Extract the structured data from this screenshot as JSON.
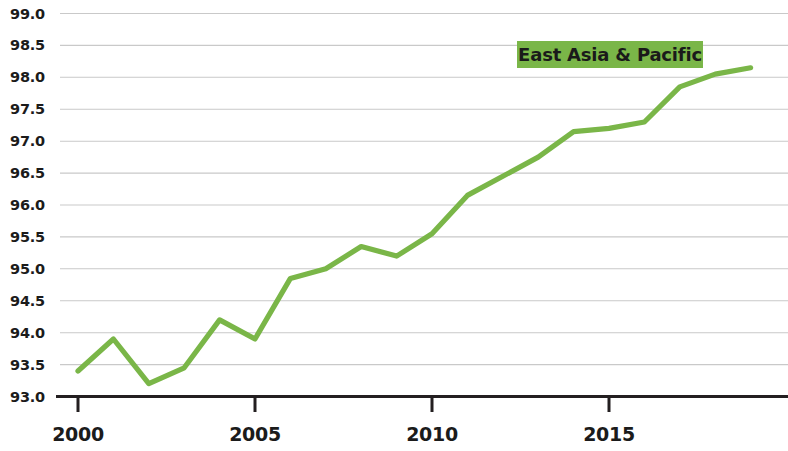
{
  "chart_data": {
    "type": "line",
    "title": "",
    "subtitle": "",
    "xlabel": "",
    "ylabel": "",
    "xlim": [
      2000,
      2019
    ],
    "ylim": [
      93.0,
      99.0
    ],
    "grid": true,
    "legend_position": "top-right",
    "x": [
      2000,
      2001,
      2002,
      2003,
      2004,
      2005,
      2006,
      2007,
      2008,
      2009,
      2010,
      2011,
      2012,
      2013,
      2014,
      2015,
      2016,
      2017,
      2018,
      2019
    ],
    "series": [
      {
        "name": "East Asia & Pacific",
        "color": "#7ab648",
        "values": [
          93.4,
          93.9,
          93.2,
          93.45,
          94.2,
          93.9,
          94.85,
          95.0,
          95.35,
          95.2,
          95.55,
          96.15,
          96.45,
          96.75,
          97.15,
          97.2,
          97.3,
          97.85,
          98.05,
          98.15
        ]
      }
    ],
    "y_ticks": [
      99.0,
      98.5,
      98.0,
      97.5,
      97.0,
      96.5,
      96.0,
      95.5,
      95.0,
      94.5,
      94.0,
      93.5,
      93.0
    ],
    "y_tick_labels": [
      "99.0",
      "98.5",
      "98.0",
      "97.5",
      "97.0",
      "96.5",
      "96.0",
      "95.5",
      "95.0",
      "94.5",
      "94.0",
      "93.5",
      "93.0"
    ],
    "x_ticks": [
      2000,
      2005,
      2010,
      2015
    ],
    "x_tick_labels": [
      "2000",
      "2005",
      "2010",
      "2015"
    ]
  },
  "legend": {
    "label": "East Asia & Pacific",
    "background_color": "#7ab648",
    "text_color": "#1a1a1a"
  },
  "colors": {
    "line": "#7ab648",
    "grid": "#c9c9c9",
    "axis": "#231f20",
    "background": "#ffffff",
    "tick_label": "#1b1b1b"
  }
}
